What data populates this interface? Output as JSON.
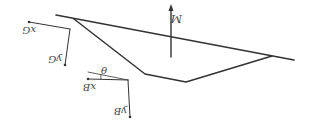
{
  "diagram": {
    "orientation": "rotated 180 degrees",
    "colors": {
      "stroke": "#333333",
      "label": "#444444",
      "background": "#ffffff"
    },
    "waterline": {
      "x1": 56,
      "y1": 15,
      "x2": 294,
      "y2": 60
    },
    "hull": {
      "points": "74,19 145,74 186,82 272,56"
    },
    "moment_arrow": {
      "label": "M",
      "x": 171,
      "y_bottom": 57,
      "y_top": 6
    },
    "global_frame": {
      "x_label": "x_G",
      "y_label": "y_G",
      "x_text": "xG",
      "y_text": "yG",
      "origin": {
        "x": 70,
        "y": 29
      },
      "x_end": {
        "x": 29,
        "y": 22
      },
      "y_end": {
        "x": 65,
        "y": 65
      }
    },
    "body_frame": {
      "x_label": "x_B",
      "y_label": "y_B",
      "x_text": "xB",
      "y_text": "yB",
      "origin": {
        "x": 128,
        "y": 80
      },
      "x_end": {
        "x": 88,
        "y": 79
      },
      "y_end": {
        "x": 130,
        "y": 117
      }
    },
    "angle": {
      "label": "θ",
      "ref_line": {
        "x1": 128,
        "y1": 80,
        "x2": 88,
        "y2": 72
      }
    }
  }
}
